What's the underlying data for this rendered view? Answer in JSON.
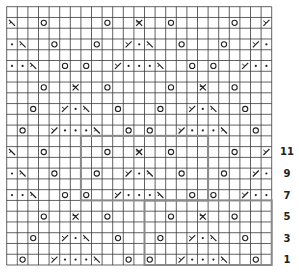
{
  "chart": {
    "columns": 25,
    "rows": 24,
    "row_labels": [
      "1",
      "3",
      "5",
      "7",
      "9",
      "11"
    ],
    "legend_symbols": {
      "O": "yarn-over",
      "\\": "ssk",
      "/": "k2tog",
      "X": "sk2p",
      ".": "purl"
    },
    "grid_line_color": "#3a3a3a",
    "repeat_outline_color": "#8a8a8a",
    "symbol_color": "#222222",
    "symbol_rows": [
      {
        "row": 1,
        "cells": [
          [
            2,
            "O"
          ],
          [
            5,
            "/"
          ],
          [
            6,
            "."
          ],
          [
            7,
            "."
          ],
          [
            8,
            "."
          ],
          [
            9,
            "\\"
          ],
          [
            12,
            "O"
          ],
          [
            14,
            "O"
          ],
          [
            17,
            "/"
          ],
          [
            18,
            "."
          ],
          [
            19,
            "."
          ],
          [
            20,
            "."
          ],
          [
            21,
            "\\"
          ],
          [
            24,
            "O"
          ]
        ]
      },
      {
        "row": 3,
        "cells": [
          [
            3,
            "O"
          ],
          [
            6,
            "/"
          ],
          [
            7,
            "."
          ],
          [
            8,
            "\\"
          ],
          [
            11,
            "O"
          ],
          [
            15,
            "O"
          ],
          [
            18,
            "/"
          ],
          [
            19,
            "."
          ],
          [
            20,
            "\\"
          ],
          [
            23,
            "O"
          ]
        ]
      },
      {
        "row": 5,
        "cells": [
          [
            4,
            "O"
          ],
          [
            7,
            "X"
          ],
          [
            10,
            "O"
          ],
          [
            16,
            "O"
          ],
          [
            19,
            "X"
          ],
          [
            22,
            "O"
          ]
        ]
      },
      {
        "row": 7,
        "cells": [
          [
            1,
            "."
          ],
          [
            2,
            "."
          ],
          [
            3,
            "\\"
          ],
          [
            6,
            "O"
          ],
          [
            8,
            "O"
          ],
          [
            11,
            "/"
          ],
          [
            12,
            "."
          ],
          [
            13,
            "."
          ],
          [
            14,
            "."
          ],
          [
            15,
            "\\"
          ],
          [
            18,
            "O"
          ],
          [
            20,
            "O"
          ],
          [
            23,
            "/"
          ],
          [
            24,
            "."
          ],
          [
            25,
            "."
          ]
        ]
      },
      {
        "row": 9,
        "cells": [
          [
            1,
            "."
          ],
          [
            2,
            "\\"
          ],
          [
            5,
            "O"
          ],
          [
            9,
            "O"
          ],
          [
            12,
            "/"
          ],
          [
            13,
            "."
          ],
          [
            14,
            "\\"
          ],
          [
            17,
            "O"
          ],
          [
            21,
            "O"
          ],
          [
            24,
            "/"
          ],
          [
            25,
            "."
          ]
        ]
      },
      {
        "row": 11,
        "cells": [
          [
            1,
            "\\"
          ],
          [
            4,
            "O"
          ],
          [
            10,
            "O"
          ],
          [
            13,
            "X"
          ],
          [
            16,
            "O"
          ],
          [
            22,
            "O"
          ],
          [
            25,
            "/"
          ]
        ]
      },
      {
        "row": 13,
        "cells": [
          [
            2,
            "O"
          ],
          [
            5,
            "/"
          ],
          [
            6,
            "."
          ],
          [
            7,
            "."
          ],
          [
            8,
            "."
          ],
          [
            9,
            "\\"
          ],
          [
            12,
            "O"
          ],
          [
            14,
            "O"
          ],
          [
            17,
            "/"
          ],
          [
            18,
            "."
          ],
          [
            19,
            "."
          ],
          [
            20,
            "."
          ],
          [
            21,
            "\\"
          ],
          [
            24,
            "O"
          ]
        ]
      },
      {
        "row": 15,
        "cells": [
          [
            3,
            "O"
          ],
          [
            6,
            "/"
          ],
          [
            7,
            "."
          ],
          [
            8,
            "\\"
          ],
          [
            11,
            "O"
          ],
          [
            15,
            "O"
          ],
          [
            18,
            "/"
          ],
          [
            19,
            "."
          ],
          [
            20,
            "\\"
          ],
          [
            23,
            "O"
          ]
        ]
      },
      {
        "row": 17,
        "cells": [
          [
            4,
            "O"
          ],
          [
            7,
            "X"
          ],
          [
            10,
            "O"
          ],
          [
            16,
            "O"
          ],
          [
            19,
            "X"
          ],
          [
            22,
            "O"
          ]
        ]
      },
      {
        "row": 19,
        "cells": [
          [
            1,
            "."
          ],
          [
            2,
            "."
          ],
          [
            3,
            "\\"
          ],
          [
            6,
            "O"
          ],
          [
            8,
            "O"
          ],
          [
            11,
            "/"
          ],
          [
            12,
            "."
          ],
          [
            13,
            "."
          ],
          [
            14,
            "."
          ],
          [
            15,
            "\\"
          ],
          [
            18,
            "O"
          ],
          [
            20,
            "O"
          ],
          [
            23,
            "/"
          ],
          [
            24,
            "."
          ],
          [
            25,
            "."
          ]
        ]
      },
      {
        "row": 21,
        "cells": [
          [
            1,
            "."
          ],
          [
            2,
            "\\"
          ],
          [
            5,
            "O"
          ],
          [
            9,
            "O"
          ],
          [
            12,
            "/"
          ],
          [
            13,
            "."
          ],
          [
            14,
            "\\"
          ],
          [
            17,
            "O"
          ],
          [
            21,
            "O"
          ],
          [
            24,
            "/"
          ],
          [
            25,
            "."
          ]
        ]
      },
      {
        "row": 23,
        "cells": [
          [
            1,
            "\\"
          ],
          [
            4,
            "O"
          ],
          [
            10,
            "O"
          ],
          [
            13,
            "X"
          ],
          [
            16,
            "O"
          ],
          [
            22,
            "O"
          ],
          [
            25,
            "/"
          ]
        ]
      }
    ],
    "repeat_outline": {
      "blocks": [
        {
          "cols": [
            8,
            19
          ],
          "rows": [
            7,
            12
          ]
        },
        {
          "cols": [
            14,
            25
          ],
          "rows": [
            1,
            6
          ]
        }
      ]
    }
  }
}
